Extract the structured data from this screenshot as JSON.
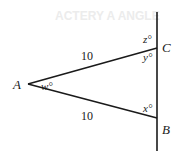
{
  "diagram": {
    "background_text": "ACTERY A ANGLE",
    "points": {
      "A": {
        "label": "A",
        "x": 28,
        "y": 84
      },
      "B": {
        "label": "B",
        "x": 157,
        "y": 118
      },
      "C": {
        "label": "C",
        "x": 157,
        "y": 48
      }
    },
    "vertical_line": {
      "x": 157,
      "y1": 12,
      "y2": 151
    },
    "sides": {
      "AC": {
        "length_label": "10"
      },
      "AB": {
        "length_label": "10"
      }
    },
    "angles": {
      "w": "w°",
      "x": "x°",
      "y": "y°",
      "z": "z°"
    },
    "colors": {
      "line": "#1a1a1a",
      "background": "#ffffff"
    }
  }
}
